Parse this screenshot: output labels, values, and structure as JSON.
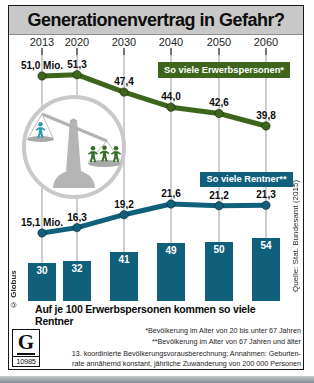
{
  "title": "Generationenvertrag in Gefahr?",
  "caption": "Auf je 100 Erwerbspersonen kommen so viele Rentner",
  "credit": "© Globus",
  "source": "Quelle: Stat. Bundesamt (2015)",
  "logo": {
    "letter": "G",
    "number": "10985"
  },
  "footnotes": {
    "star": "*Bevölkerung im Alter von 20 bis unter 67 Jahren",
    "doublestar": "**Bevölkerung im Alter von 67 Jahren und älter",
    "method_line1": "13. koordinierte Bevölkerungsvorausberechnung; Annahmen: Geburten-",
    "method_line2": "rate annähernd konstant, jährliche Zuwanderung von 200 000 Personen"
  },
  "colors": {
    "green": "#3d661c",
    "teal": "#11607b",
    "title_bg": "#c8c8c8",
    "figure_teal": "#2d9cae",
    "figure_green": "#336e27",
    "scale_gray": "#b5b5b5"
  },
  "chart_data": {
    "type": "line",
    "categories": [
      "2013",
      "2020",
      "2030",
      "2040",
      "2050",
      "2060"
    ],
    "unit": "Mio.",
    "legend_position": "inline-badges",
    "grid": "vertical-only",
    "series": [
      {
        "id": "erwerbspersonen",
        "type": "line",
        "name": "So viele Erwerbspersonen*",
        "color": "#3d661c",
        "values": [
          51.0,
          51.3,
          47.4,
          44.0,
          42.6,
          39.8
        ],
        "labels": [
          "51,0 Mio.",
          "51,3",
          "47,4",
          "44,0",
          "42,6",
          "39,8"
        ]
      },
      {
        "id": "rentner",
        "type": "line",
        "name": "So viele Rentner**",
        "color": "#11607b",
        "values": [
          15.1,
          16.3,
          19.2,
          21.6,
          21.2,
          21.3
        ],
        "labels": [
          "15,1 Mio.",
          "16,3",
          "19,2",
          "21,6",
          "21,2",
          "21,3"
        ]
      },
      {
        "id": "rentner-je-100-erwerbspersonen",
        "type": "bar",
        "name": "Auf je 100 Erwerbspersonen kommen so viele Rentner",
        "color": "#11607b",
        "values": [
          30,
          32,
          41,
          49,
          50,
          54
        ]
      }
    ]
  }
}
